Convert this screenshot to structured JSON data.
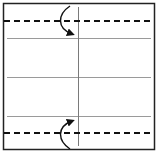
{
  "diagram": {
    "type": "origami-fold-diagram",
    "colors": {
      "background": "#ffffff",
      "border": "#222222",
      "crease": "#9a9a9a",
      "dashed": "#111111",
      "arrow": "#111111"
    },
    "paper": {
      "x": 3,
      "y": 3,
      "width": 152,
      "height": 147
    },
    "creases": [
      {
        "orientation": "horizontal",
        "y": 38
      },
      {
        "orientation": "horizontal",
        "y": 77
      },
      {
        "orientation": "horizontal",
        "y": 116
      },
      {
        "orientation": "vertical",
        "x": 78
      }
    ],
    "fold_lines": [
      {
        "style": "valley-fold-dashed",
        "y": 21
      },
      {
        "style": "valley-fold-dashed",
        "y": 133
      }
    ],
    "arrows": [
      {
        "direction": "down",
        "from": "top-edge",
        "to": "crease-1"
      },
      {
        "direction": "up",
        "from": "bottom-edge",
        "to": "crease-3"
      }
    ]
  }
}
